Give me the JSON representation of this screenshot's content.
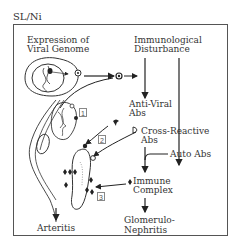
{
  "figure": {
    "label": "SL/Ni"
  },
  "diagram": {
    "left_header": [
      "Expression of",
      "Viral Genome"
    ],
    "right_header": [
      "Immunological",
      "Disturbance"
    ],
    "nodes": {
      "anti_viral_abs": [
        "Anti-Viral",
        "Abs"
      ],
      "cross_reactive_abs": [
        "Cross-Reactive",
        "Abs"
      ],
      "auto_abs": "Auto Abs",
      "immune_complex": [
        "Immune",
        "Complex"
      ],
      "glomerulonephritis": [
        "Glomerulo-",
        "Nephritis"
      ],
      "arteritis": "Arteritis"
    },
    "step_markers": [
      "1",
      "2",
      "3"
    ]
  }
}
